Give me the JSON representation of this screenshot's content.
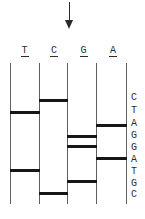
{
  "figure": {
    "type": "dna-sequencing-gel-diagram",
    "arrow": {
      "icon": "down-arrow",
      "direction": "down"
    },
    "gel": {
      "lane_labels": [
        "T",
        "C",
        "G",
        "A"
      ],
      "rows": [
        {
          "letter": "C",
          "lane": "C"
        },
        {
          "letter": "T",
          "lane": "T"
        },
        {
          "letter": "A",
          "lane": "A"
        },
        {
          "letter": "G",
          "lane": "G"
        },
        {
          "letter": "G",
          "lane": "G"
        },
        {
          "letter": "A",
          "lane": "A"
        },
        {
          "letter": "T",
          "lane": "T"
        },
        {
          "letter": "G",
          "lane": "G"
        },
        {
          "letter": "C",
          "lane": "C"
        }
      ],
      "sequence_read_top_to_bottom": "CTAGGATGC"
    },
    "colors": {
      "band": "#161616",
      "lane_line": "#5f5f5f",
      "text": "#2e2e2e",
      "arrow": "#2a2a2a",
      "background": "#ffffff"
    }
  }
}
